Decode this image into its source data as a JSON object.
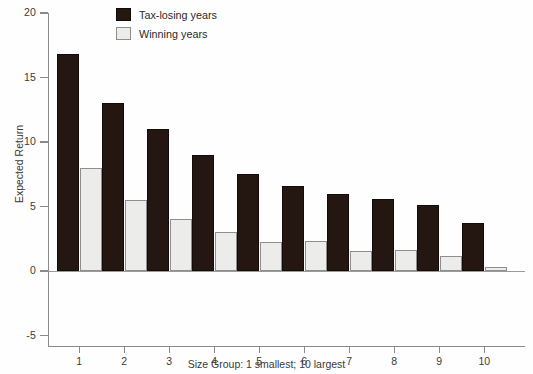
{
  "chart_data": {
    "type": "bar",
    "title": "",
    "xlabel": "Size Group: 1 smallest; 10 largest",
    "ylabel": "Expected Return",
    "categories": [
      "1",
      "2",
      "3",
      "4",
      "5",
      "6",
      "7",
      "8",
      "9",
      "10"
    ],
    "ylim": [
      -5,
      20
    ],
    "yticks": [
      20,
      15,
      10,
      5,
      0,
      -5
    ],
    "ytick_labels": [
      "20",
      "15",
      "10",
      "5",
      "0",
      "-5"
    ],
    "grid": false,
    "legend_position": "top-center",
    "series": [
      {
        "name": "Tax-losing years",
        "color": "#241712",
        "values": [
          16.8,
          13.0,
          11.0,
          9.0,
          7.5,
          6.6,
          6.0,
          5.55,
          5.1,
          3.7
        ]
      },
      {
        "name": "Winning years",
        "color": "#ececeb",
        "values": [
          8.0,
          5.5,
          4.0,
          3.0,
          2.25,
          2.3,
          1.55,
          1.6,
          1.15,
          0.3
        ]
      }
    ]
  }
}
